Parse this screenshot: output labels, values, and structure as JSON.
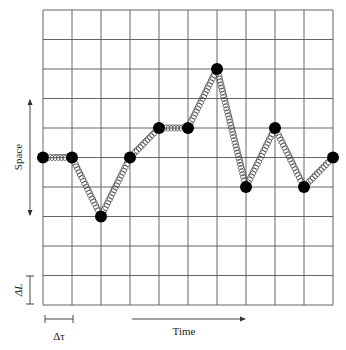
{
  "diagram": {
    "type": "spacetime lattice with masses connected by springs",
    "grid": {
      "columns": 10,
      "rows": 10,
      "left": 43,
      "top": 10,
      "cell_width": 29,
      "cell_height": 29.5,
      "line_color": "#555555"
    },
    "masses": [
      {
        "t": 0,
        "s": 5
      },
      {
        "t": 1,
        "s": 5
      },
      {
        "t": 2,
        "s": 7
      },
      {
        "t": 3,
        "s": 5
      },
      {
        "t": 4,
        "s": 4
      },
      {
        "t": 5,
        "s": 4
      },
      {
        "t": 6,
        "s": 2
      },
      {
        "t": 7,
        "s": 6
      },
      {
        "t": 8,
        "s": 4
      },
      {
        "t": 9,
        "s": 6
      },
      {
        "t": 10,
        "s": 5
      }
    ],
    "mass_color": "#000000",
    "spring_color": "#444444",
    "labels": {
      "space": "Space",
      "time": "Time",
      "delta_l": "ΔL",
      "delta_tau": "Δτ"
    }
  }
}
